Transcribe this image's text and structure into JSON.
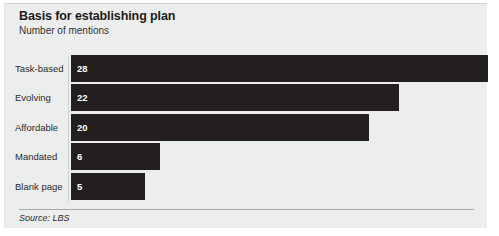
{
  "header": {
    "title": "Basis for establishing plan",
    "subtitle": "Number of mentions"
  },
  "footer": {
    "source": "Source: LBS"
  },
  "style": {
    "panel_background": "#eceded",
    "bar_color": "#231f20",
    "value_label_color": "#ffffff",
    "category_label_color": "#2b2b2b",
    "axis_line_color": "#d2d3d4",
    "rule_color": "#a8a9aa"
  },
  "chart_data": {
    "type": "bar",
    "orientation": "horizontal",
    "title": "Basis for establishing plan",
    "subtitle": "Number of mentions",
    "xlabel": "",
    "ylabel": "",
    "value_unit": "mentions",
    "grid": false,
    "legend": false,
    "axis_labels_shown": false,
    "value_labels_inside_bars": true,
    "xlim": [
      0,
      28
    ],
    "categories": [
      "Task-based",
      "Evolving",
      "Affordable",
      "Mandated",
      "Blank page"
    ],
    "values": [
      28,
      22,
      20,
      6,
      5
    ],
    "source": "Source: LBS",
    "bars": [
      {
        "category": "Task-based",
        "value": 28,
        "value_label": "28"
      },
      {
        "category": "Evolving",
        "value": 22,
        "value_label": "22"
      },
      {
        "category": "Affordable",
        "value": 20,
        "value_label": "20"
      },
      {
        "category": "Mandated",
        "value": 6,
        "value_label": "6"
      },
      {
        "category": "Blank page",
        "value": 5,
        "value_label": "5"
      }
    ]
  }
}
